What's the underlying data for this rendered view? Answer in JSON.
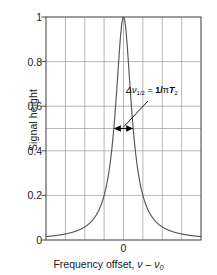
{
  "figure": {
    "title": "",
    "background_color": "#ffffff",
    "frame_color": "#4d4d4d",
    "grid_color": "#9a9a9a",
    "curve_color": "#555555",
    "arrow_color": "#000000"
  },
  "axes": {
    "y_title": "Signal height",
    "x_title_prefix": "Frequency offset, ",
    "x_title_symbol": "ν – ν",
    "x_title_subscript": "0",
    "y_tick_labels": [
      "1",
      "0.8",
      "0.6",
      "0.4",
      "0.2",
      "0"
    ],
    "y_tick_values": [
      1,
      0.8,
      0.6,
      0.4,
      0.2,
      0
    ],
    "y_extra_gridlines": [
      0.5
    ],
    "x_tick_labels": [
      "0"
    ],
    "x_tick_values": [
      0
    ]
  },
  "annotation": {
    "delta_symbol": "Δ",
    "nu_symbol": "ν",
    "subscript": "1/2",
    "equals": " = ",
    "expression_numerator": "1/",
    "pi_symbol": "π",
    "t_symbol": "T",
    "t_subscript": "2",
    "full_text": "Δν₁₂ = 1/πT₂",
    "marker_label": "half-width-at-half-maximum-arrow"
  },
  "chart_data": {
    "type": "line",
    "title": "",
    "xlabel": "Frequency offset, ν – ν0",
    "ylabel": "Signal height",
    "xlim": [
      -4,
      4
    ],
    "ylim": [
      0,
      1
    ],
    "grid": true,
    "legend": null,
    "lineshape": "Lorentzian",
    "halfwidth_half_maximum": 0.5,
    "peak_center": 0,
    "peak_height": 1,
    "x": [
      -4.0,
      -3.75,
      -3.5,
      -3.25,
      -3.0,
      -2.75,
      -2.5,
      -2.25,
      -2.0,
      -1.75,
      -1.5,
      -1.25,
      -1.0,
      -0.875,
      -0.75,
      -0.625,
      -0.5,
      -0.4375,
      -0.375,
      -0.3125,
      -0.25,
      -0.1875,
      -0.125,
      -0.0625,
      0.0,
      0.0625,
      0.125,
      0.1875,
      0.25,
      0.3125,
      0.375,
      0.4375,
      0.5,
      0.625,
      0.75,
      0.875,
      1.0,
      1.25,
      1.5,
      1.75,
      2.0,
      2.25,
      2.5,
      2.75,
      3.0,
      3.25,
      3.5,
      3.75,
      4.0
    ],
    "y": [
      0.0153,
      0.0175,
      0.02,
      0.0231,
      0.027,
      0.0319,
      0.0385,
      0.0471,
      0.0588,
      0.0755,
      0.1,
      0.1379,
      0.2,
      0.2462,
      0.3077,
      0.3902,
      0.5,
      0.5647,
      0.64,
      0.7191,
      0.8,
      0.8767,
      0.9412,
      0.9846,
      1.0,
      0.9846,
      0.9412,
      0.8767,
      0.8,
      0.7191,
      0.64,
      0.5647,
      0.5,
      0.3902,
      0.3077,
      0.2462,
      0.2,
      0.1379,
      0.1,
      0.0755,
      0.0588,
      0.0471,
      0.0385,
      0.0319,
      0.027,
      0.0231,
      0.02,
      0.0175,
      0.0153
    ],
    "annotations": [
      {
        "text": "Δν1/2 = 1/πT2",
        "kind": "double-headed-arrow",
        "y_level": 0.5,
        "x_start": -0.5,
        "x_end": 0.5
      }
    ]
  }
}
